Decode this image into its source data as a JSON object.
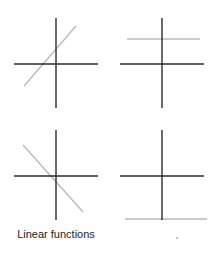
{
  "caption": "Linear functions",
  "colors": {
    "axis": "#2b2b2b",
    "function_line": "#b8b8b8"
  },
  "panels": [
    {
      "name": "increasing",
      "axes": {
        "x1": 14,
        "x2": 98,
        "y": 64,
        "vx": 56,
        "vy1": 18,
        "vy2": 108
      },
      "line": {
        "x1": 24,
        "y1": 86,
        "x2": 76,
        "y2": 26
      }
    },
    {
      "name": "constant-positive",
      "axes": {
        "x1": 120,
        "x2": 204,
        "y": 64,
        "vx": 162,
        "vy1": 18,
        "vy2": 108
      },
      "line": {
        "x1": 127,
        "y1": 39,
        "x2": 200,
        "y2": 39
      }
    },
    {
      "name": "decreasing",
      "axes": {
        "x1": 14,
        "x2": 98,
        "y": 176,
        "vx": 56,
        "vy1": 130,
        "vy2": 220
      },
      "line": {
        "x1": 23,
        "y1": 145,
        "x2": 83,
        "y2": 212
      }
    },
    {
      "name": "constant-negative",
      "axes": {
        "x1": 120,
        "x2": 204,
        "y": 176,
        "vx": 162,
        "vy1": 130,
        "vy2": 220
      },
      "line": {
        "x1": 125,
        "y1": 219,
        "x2": 207,
        "y2": 219
      }
    }
  ]
}
